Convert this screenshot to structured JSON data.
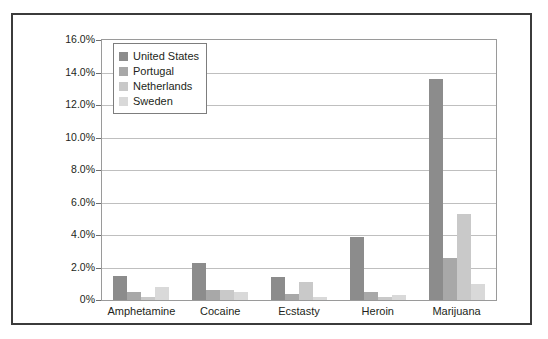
{
  "chart_data": {
    "type": "bar",
    "title": "",
    "xlabel": "",
    "ylabel": "",
    "ylim": [
      0,
      16
    ],
    "grid": true,
    "legend_position": "top-left",
    "categories": [
      "Amphetamine",
      "Cocaine",
      "Ecstasty",
      "Heroin",
      "Marijuana"
    ],
    "ytick_labels": [
      "16.0%",
      "14.0%",
      "12.0%",
      "10.0%",
      "8.0%",
      "6.0%",
      "4.0%",
      "2.0%",
      "0%"
    ],
    "ytick_values": [
      16,
      14,
      12,
      10,
      8,
      6,
      4,
      2,
      0
    ],
    "series": [
      {
        "name": "United States",
        "color": "#8c8c8c",
        "values": [
          1.5,
          2.3,
          1.4,
          3.9,
          13.6
        ]
      },
      {
        "name": "Portugal",
        "color": "#a8a8a8",
        "values": [
          0.5,
          0.6,
          0.4,
          0.5,
          2.6
        ]
      },
      {
        "name": "Netherlands",
        "color": "#c9c9c9",
        "values": [
          0.2,
          0.6,
          1.1,
          0.2,
          5.3
        ]
      },
      {
        "name": "Sweden",
        "color": "#d9d9d9",
        "values": [
          0.8,
          0.5,
          0.2,
          0.3,
          1.0
        ]
      }
    ]
  }
}
